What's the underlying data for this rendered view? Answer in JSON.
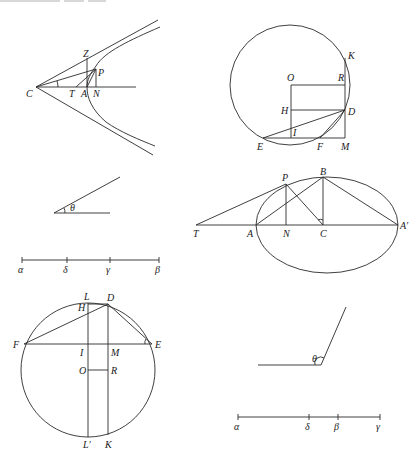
{
  "figures": {
    "hyperbola": {
      "labels": {
        "Z": "Z",
        "P": "P",
        "C": "C",
        "T": "T",
        "A": "A",
        "N": "N"
      }
    },
    "circle_top": {
      "labels": {
        "K": "K",
        "O": "O",
        "R": "R",
        "H": "H",
        "D": "D",
        "I": "I",
        "E": "E",
        "F": "F",
        "M": "M"
      }
    },
    "angle_acute": {
      "labels": {
        "theta": "θ"
      }
    },
    "ellipse": {
      "labels": {
        "P": "P",
        "B": "B",
        "T": "T",
        "A": "A",
        "N": "N",
        "C": "C",
        "A_prime": "A′"
      }
    },
    "line_1": {
      "labels": {
        "alpha": "α",
        "delta": "δ",
        "gamma": "γ",
        "beta": "β"
      }
    },
    "circle_bottom": {
      "labels": {
        "L": "L",
        "D": "D",
        "H": "H",
        "F": "F",
        "E": "E",
        "I": "I",
        "M": "M",
        "O": "O",
        "R": "R",
        "L_prime": "L′",
        "K": "K"
      }
    },
    "angle_obtuse": {
      "labels": {
        "theta": "θ"
      }
    },
    "line_2": {
      "labels": {
        "alpha": "α",
        "delta": "δ",
        "beta": "β",
        "gamma": "γ"
      }
    }
  }
}
